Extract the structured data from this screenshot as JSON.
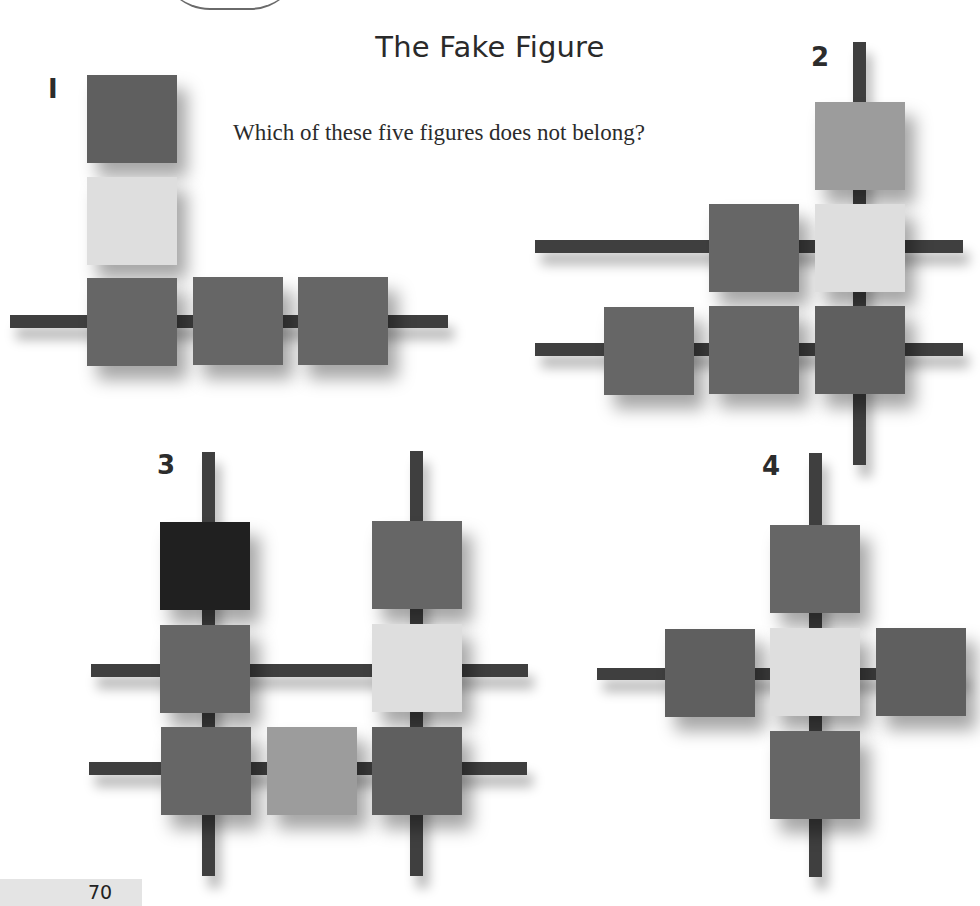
{
  "page": {
    "title": "The Fake Figure",
    "question": "Which of these five figures does not belong?",
    "page_number": "70"
  },
  "figures": [
    {
      "label": "I"
    },
    {
      "label": "2"
    },
    {
      "label": "3"
    },
    {
      "label": "4"
    }
  ],
  "colors": {
    "bar": "#3f3f3f",
    "square_dark": "#5f5f5f",
    "square_mid": "#666666",
    "square_light": "#dedede",
    "square_light_mid": "#9c9c9c",
    "square_black": "#202020"
  }
}
